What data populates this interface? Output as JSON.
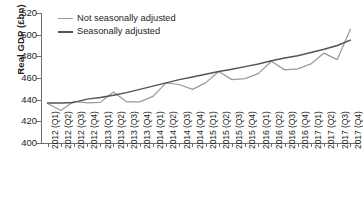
{
  "chart_data": {
    "type": "line",
    "title": "",
    "xlabel": "",
    "ylabel": "Real GDP (£bn)",
    "ylim": [
      400,
      520
    ],
    "yticks": [
      400,
      420,
      440,
      460,
      480,
      500,
      520
    ],
    "grid": false,
    "legend_position": "top-left",
    "categories": [
      "2012 (Q1)",
      "2012 (Q2)",
      "2012 (Q3)",
      "2012 (Q4)",
      "2013 (Q1)",
      "2013 (Q2)",
      "2013 (Q3)",
      "2013 (Q4)",
      "2014 (Q1)",
      "2014 (Q2)",
      "2014 (Q3)",
      "2014 (Q4)",
      "2015 (Q1)",
      "2015 (Q2)",
      "2015 (Q3)",
      "2015 (Q4)",
      "2016 (Q1)",
      "2016 (Q2)",
      "2016 (Q3)",
      "2016 (Q4)",
      "2017 (Q1)",
      "2017 (Q2)",
      "2017 (Q3)",
      "2017 (Q4)"
    ],
    "series": [
      {
        "name": "Not seasonally adjusted",
        "color": "#9a9a9a",
        "values": [
          436.5,
          430.0,
          438.5,
          437.0,
          437.5,
          447.0,
          438.0,
          438.0,
          443.0,
          455.5,
          454.0,
          449.5,
          455.5,
          466.0,
          458.5,
          459.5,
          464.0,
          475.5,
          467.5,
          468.5,
          473.0,
          483.0,
          477.0,
          505.0
        ]
      },
      {
        "name": "Seasonally adjusted",
        "color": "#545456",
        "values": [
          437.0,
          437.0,
          437.5,
          440.5,
          442.0,
          444.0,
          446.5,
          449.5,
          452.5,
          455.5,
          458.5,
          461.0,
          463.5,
          466.0,
          468.0,
          470.5,
          473.0,
          476.0,
          478.5,
          480.5,
          483.5,
          486.5,
          490.0,
          495.0
        ]
      }
    ]
  },
  "legend": {
    "items": [
      {
        "label": "Not seasonally adjusted"
      },
      {
        "label": "Seasonally adjusted"
      }
    ]
  }
}
